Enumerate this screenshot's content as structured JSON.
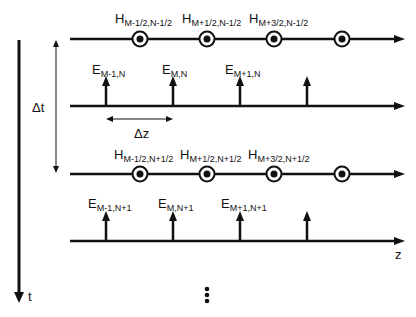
{
  "diagram": {
    "title": "",
    "type": "FDTD Yee staggered grid (space-time leapfrog)",
    "colors": {
      "stroke": "#111111",
      "background": "#ffffff"
    },
    "axes": {
      "time_axis_label": "t",
      "space_axis_label": "z"
    },
    "dimensions": {
      "dt_label": "Δt",
      "dz_label": "Δz"
    },
    "continuation": "⋮",
    "rows": [
      {
        "kind": "H",
        "labels": [
          {
            "main": "H",
            "sub": "M-1/2,N-1/2"
          },
          {
            "main": "H",
            "sub": "M+1/2,N-1/2"
          },
          {
            "main": "H",
            "sub": "M+3/2,N-1/2"
          }
        ]
      },
      {
        "kind": "E",
        "labels": [
          {
            "main": "E",
            "sub": "M-1,N"
          },
          {
            "main": "E",
            "sub": "M,N"
          },
          {
            "main": "E",
            "sub": "M+1,N"
          }
        ]
      },
      {
        "kind": "H",
        "labels": [
          {
            "main": "H",
            "sub": "M-1/2,N+1/2"
          },
          {
            "main": "H",
            "sub": "M+1/2,N+1/2"
          },
          {
            "main": "H",
            "sub": "M+3/2,N+1/2"
          }
        ]
      },
      {
        "kind": "E",
        "labels": [
          {
            "main": "E",
            "sub": "M-1,N+1"
          },
          {
            "main": "E",
            "sub": "M,N+1"
          },
          {
            "main": "E",
            "sub": "M+1,N+1"
          }
        ]
      }
    ],
    "icons": {
      "h_node": "circled-dot (field out of page)",
      "e_node": "up-arrow (field vector)"
    }
  }
}
